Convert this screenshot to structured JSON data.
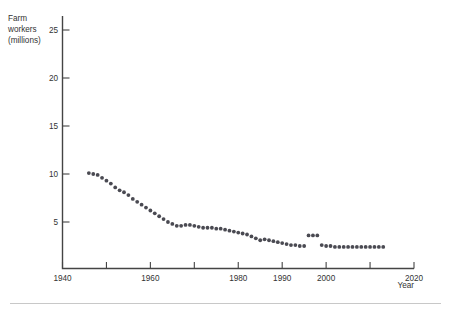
{
  "chart_data": {
    "type": "scatter",
    "title": "",
    "subtitle": "",
    "xlabel": "Year",
    "ylabel": "Farm workers (millions)",
    "ylabel_lines": [
      "Farm",
      "workers",
      "(millions)"
    ],
    "xlim": [
      1940,
      2020
    ],
    "ylim": [
      0,
      26
    ],
    "grid": false,
    "legend": null,
    "x_ticks_major": [
      1940,
      1960,
      1980,
      1990,
      2000,
      2020
    ],
    "x_ticks_all": [
      1940,
      1950,
      1960,
      1970,
      1980,
      1990,
      2000,
      2010,
      2020
    ],
    "x_tick_labels": [
      "1940",
      "1960",
      "1980",
      "1990",
      "2000",
      "2020"
    ],
    "y_ticks": [
      5,
      10,
      15,
      20,
      25
    ],
    "y_tick_labels": [
      "5",
      "10",
      "15",
      "20",
      "25"
    ],
    "marker": "filled-circle",
    "marker_color": "#4a4a52",
    "series": [
      {
        "name": "Farm workers",
        "x": [
          1946,
          1947,
          1948,
          1949,
          1950,
          1951,
          1952,
          1953,
          1954,
          1955,
          1956,
          1957,
          1958,
          1959,
          1960,
          1961,
          1962,
          1963,
          1964,
          1965,
          1966,
          1967,
          1968,
          1969,
          1970,
          1971,
          1972,
          1973,
          1974,
          1975,
          1976,
          1977,
          1978,
          1979,
          1980,
          1981,
          1982,
          1983,
          1984,
          1985,
          1986,
          1987,
          1988,
          1989,
          1990,
          1991,
          1992,
          1993,
          1994,
          1995,
          1996,
          1997,
          1998,
          1999,
          2000,
          2001,
          2002,
          2003,
          2004,
          2005,
          2006,
          2007,
          2008,
          2009,
          2010,
          2011,
          2012,
          2013
        ],
        "y": [
          10.1,
          10.0,
          9.9,
          9.6,
          9.3,
          9.0,
          8.6,
          8.3,
          8.1,
          7.8,
          7.4,
          7.1,
          6.8,
          6.5,
          6.2,
          5.9,
          5.6,
          5.3,
          5.0,
          4.8,
          4.6,
          4.6,
          4.7,
          4.7,
          4.6,
          4.5,
          4.4,
          4.4,
          4.4,
          4.3,
          4.3,
          4.2,
          4.1,
          4.0,
          3.9,
          3.8,
          3.7,
          3.5,
          3.3,
          3.1,
          3.2,
          3.1,
          3.0,
          2.9,
          2.8,
          2.7,
          2.6,
          2.6,
          2.5,
          2.5,
          3.6,
          3.6,
          3.6,
          2.6,
          2.5,
          2.5,
          2.4,
          2.4,
          2.4,
          2.4,
          2.4,
          2.4,
          2.4,
          2.4,
          2.4,
          2.4,
          2.4,
          2.4
        ],
        "note": "series has a level shift (break in comparability) around 1996-1999"
      }
    ]
  },
  "footer": {
    "rule": true
  }
}
